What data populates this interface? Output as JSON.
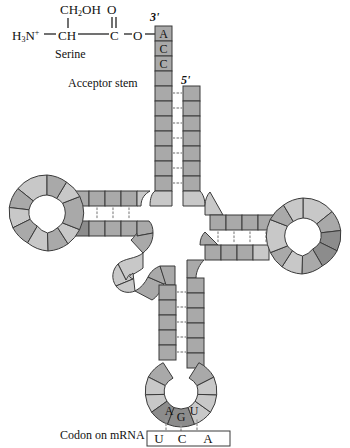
{
  "figure": {
    "amino_acid": {
      "name_label": "Serine",
      "side_chain": "CH2OH",
      "side_chain_main": "CH",
      "side_chain_sub": "2",
      "side_chain_tail": "OH",
      "carbonyl_oxygen": "O",
      "amine_main": "H",
      "amine_sub": "3",
      "amine_n": "N",
      "amine_charge": "+",
      "alpha_carbon": "CH",
      "carboxyl_carbon": "C",
      "ester_oxygen": "O"
    },
    "labels": {
      "three_prime": "3'",
      "five_prime": "5'",
      "acceptor_stem": "Acceptor stem",
      "codon_on_mrna": "Codon on mRNA"
    },
    "acceptor_end_nucleotides": [
      "A",
      "C",
      "C"
    ],
    "anticodon": [
      "A",
      "G",
      "U"
    ],
    "codon": [
      "U",
      "C",
      "A"
    ],
    "colors": {
      "nucleotide_mid": "#a9a9a9",
      "nucleotide_light": "#c8c8c8",
      "nucleotide_dark": "#8c8c8c",
      "outline": "#3a3a3a",
      "hbond": "#9a9a9a",
      "background": "#ffffff",
      "text": "#111111"
    },
    "structure": {
      "arms": [
        "acceptor stem",
        "D arm",
        "anticodon arm",
        "T arm",
        "variable loop"
      ],
      "hydrogen_bond_symbol": "dotted"
    }
  }
}
